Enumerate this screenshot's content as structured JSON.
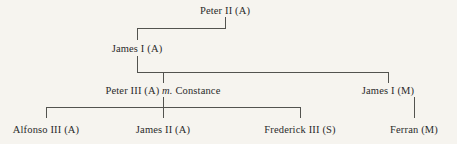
{
  "diagram": {
    "type": "genealogical-tree",
    "title": "",
    "background_color": "#f6f4ef",
    "line_color": "#53534f",
    "text_color": "#2b2b2b",
    "nodes": [
      {
        "id": "peter-ii",
        "label": "Peter II (A)",
        "name": "Peter II",
        "suffix": "(A)",
        "generation": 1,
        "x": 225,
        "y": 5
      },
      {
        "id": "james-i-a",
        "label": "James I (A)",
        "name": "James I",
        "suffix": "(A)",
        "generation": 2,
        "x": 137,
        "y": 43
      },
      {
        "id": "peter-iii",
        "label": "Peter III (A)",
        "name": "Peter III",
        "suffix": "(A)",
        "marriage_marker": "m.",
        "spouse": "Constance",
        "generation": 3,
        "x": 163,
        "y": 85
      },
      {
        "id": "james-i-m",
        "label": "James I (M)",
        "name": "James I",
        "suffix": "(M)",
        "generation": 3,
        "x": 388,
        "y": 85
      },
      {
        "id": "alfonso-iii",
        "label": "Alfonso III (A)",
        "name": "Alfonso III",
        "suffix": "(A)",
        "generation": 4,
        "x": 46,
        "y": 124
      },
      {
        "id": "james-ii",
        "label": "James II (A)",
        "name": "James II",
        "suffix": "(A)",
        "generation": 4,
        "x": 163,
        "y": 124
      },
      {
        "id": "frederick-iii",
        "label": "Frederick III (S)",
        "name": "Frederick III",
        "suffix": "(S)",
        "generation": 4,
        "x": 300,
        "y": 124
      },
      {
        "id": "ferran",
        "label": "Ferran (M)",
        "name": "Ferran",
        "suffix": "(M)",
        "generation": 4,
        "x": 414,
        "y": 124
      }
    ],
    "labels": {
      "peter_ii": "Peter II (A)",
      "james_i_a": "James I (A)",
      "peter_iii_name": "Peter III (A)",
      "marriage_marker": "m.",
      "constance": "Constance",
      "james_i_m": "James I (M)",
      "alfonso_iii": "Alfonso III (A)",
      "james_ii": "James II (A)",
      "frederick_iii": "Frederick III (S)",
      "ferran": "Ferran (M)"
    },
    "edges": [
      {
        "from": "peter-ii",
        "to": "james-i-a"
      },
      {
        "from": "james-i-a",
        "to": "peter-iii"
      },
      {
        "from": "james-i-a",
        "to": "james-i-m"
      },
      {
        "from": "peter-iii",
        "to": "alfonso-iii"
      },
      {
        "from": "peter-iii",
        "to": "james-ii"
      },
      {
        "from": "peter-iii",
        "to": "frederick-iii"
      },
      {
        "from": "james-i-m",
        "to": "ferran"
      }
    ]
  }
}
